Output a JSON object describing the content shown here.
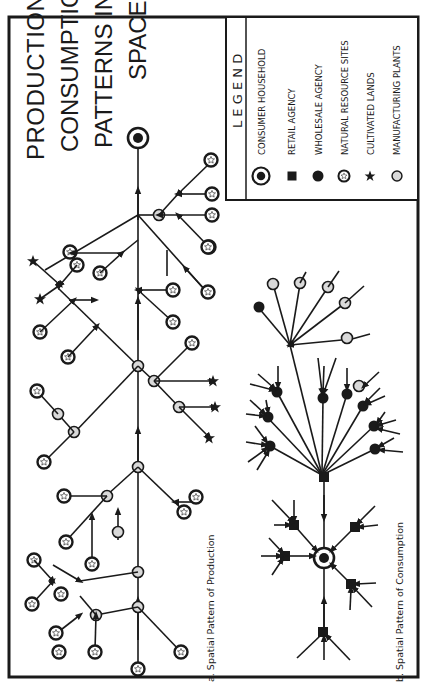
{
  "figure": {
    "title_lines": [
      "PRODUCTION &",
      "CONSUMPTION",
      "PATTERNS IN",
      "SPACE"
    ],
    "orientation": "rotated 90deg counter-clockwise"
  },
  "legend": {
    "heading": "L E G E N D",
    "items": [
      {
        "symbol": "consumer-household-icon",
        "label": "CONSUMER HOUSEHOLD"
      },
      {
        "symbol": "retail-agency-icon",
        "label": "RETAIL AGENCY"
      },
      {
        "symbol": "wholesale-agency-icon",
        "label": "WHOLESALE AGENCY"
      },
      {
        "symbol": "natural-resource-icon",
        "label": "NATURAL RESOURCE SITES"
      },
      {
        "symbol": "cultivated-land-icon",
        "label": "CULTIVATED LANDS"
      },
      {
        "symbol": "manufacturing-plant-icon",
        "label": "MANUFACTURING PLANTS"
      }
    ]
  },
  "panels": {
    "a": {
      "caption": "a.  Spatial  Pattern  of  Production"
    },
    "b": {
      "caption": "b.  Spatial  Pattern  of  Consumption"
    }
  },
  "colors": {
    "ink": "#1a1a1a",
    "plant_fill": "#d9d9d9",
    "paper": "#ffffff"
  }
}
